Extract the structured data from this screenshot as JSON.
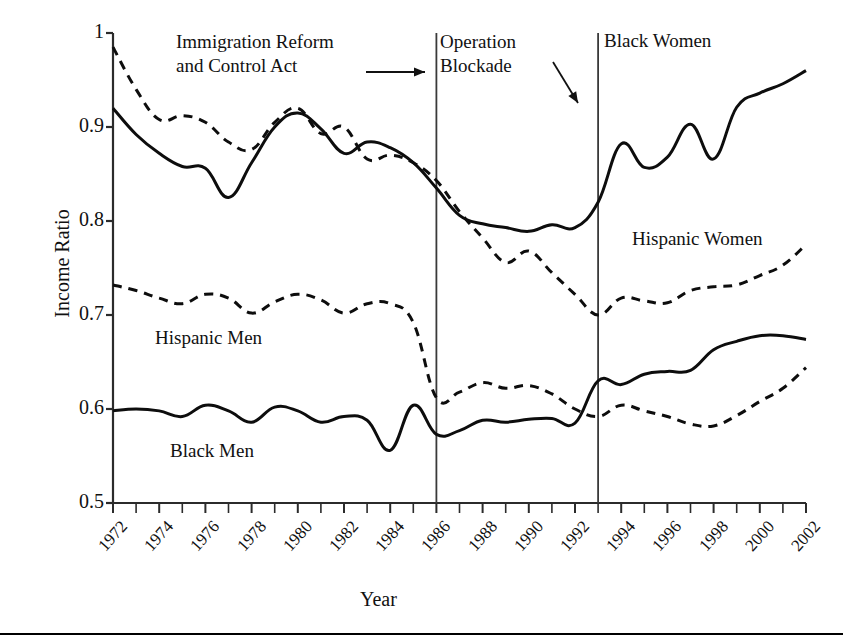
{
  "chart_data": {
    "type": "line",
    "title": "",
    "xlabel": "Year",
    "ylabel": "Income Ratio",
    "xlim": [
      1972,
      2002
    ],
    "ylim": [
      0.5,
      1.0
    ],
    "yticks": [
      "0.5",
      "0.6",
      "0.7",
      "0.8",
      "0.9",
      "1"
    ],
    "ytick_values": [
      0.5,
      0.6,
      0.7,
      0.8,
      0.9,
      1.0
    ],
    "xticks": [
      "1972",
      "1974",
      "1976",
      "1978",
      "1980",
      "1982",
      "1984",
      "1986",
      "1988",
      "1990",
      "1992",
      "1994",
      "1996",
      "1998",
      "2000",
      "2002"
    ],
    "xtick_values": [
      1972,
      1974,
      1976,
      1978,
      1980,
      1982,
      1984,
      1986,
      1988,
      1990,
      1992,
      1994,
      1996,
      1998,
      2000,
      2002
    ],
    "minor_xtick_step": 1,
    "grid": false,
    "legend_position": "inline-annotations",
    "x": [
      1972,
      1973,
      1974,
      1975,
      1976,
      1977,
      1978,
      1979,
      1980,
      1981,
      1982,
      1983,
      1984,
      1985,
      1986,
      1987,
      1988,
      1989,
      1990,
      1991,
      1992,
      1993,
      1994,
      1995,
      1996,
      1997,
      1998,
      1999,
      2000,
      2001,
      2002
    ],
    "series": [
      {
        "name": "Black Women",
        "style": "solid",
        "color": "#000000",
        "values": [
          0.92,
          0.89,
          0.872,
          0.858,
          0.856,
          0.857,
          0.862,
          0.872,
          0.893,
          0.913,
          0.908,
          0.887,
          0.87,
          0.878,
          0.884,
          0.881,
          0.873,
          0.862,
          0.848,
          0.838,
          0.834,
          0.81,
          0.799,
          0.796,
          0.795,
          0.793,
          0.788,
          0.788,
          0.795,
          0.797,
          0.792
        ]
      },
      {
        "name": "Black Women (upper dashed segment)",
        "style": "dashed",
        "color": "#000000",
        "values": [
          0.985,
          0.948,
          0.92,
          0.912,
          0.916,
          0.9,
          0.884,
          0.882,
          0.895,
          0.92,
          0.91,
          0.886,
          0.866,
          0.87,
          0.88,
          0.874,
          0.864,
          0.854,
          0.843,
          0.833,
          0.822,
          0.805,
          0.788,
          0.782,
          0.779,
          0.775,
          0.77,
          0.766,
          0.762,
          0.758,
          0.752
        ]
      },
      {
        "name": "Hispanic Men",
        "style": "dashed",
        "color": "#000000",
        "values": [
          0.73,
          0.722,
          0.716,
          0.71,
          0.705,
          0.701,
          0.712,
          0.721,
          0.719,
          0.711,
          0.703,
          0.701,
          0.71,
          0.711,
          0.702,
          0.683,
          0.67,
          0.662,
          0.661,
          0.651,
          0.645,
          0.637,
          0.628,
          0.621,
          0.617,
          0.612,
          0.608,
          0.612,
          0.616,
          0.622,
          0.631
        ]
      },
      {
        "name": "Black Men",
        "style": "solid",
        "color": "#000000",
        "values": [
          0.598,
          0.6,
          0.599,
          0.594,
          0.589,
          0.602,
          0.606,
          0.596,
          0.587,
          0.582,
          0.59,
          0.588,
          0.583,
          0.578,
          0.572,
          0.576,
          0.58,
          0.584,
          0.586,
          0.586,
          0.585,
          0.585,
          0.583,
          0.58,
          0.578,
          0.578,
          0.58,
          0.585,
          0.59,
          0.598,
          0.608
        ]
      }
    ],
    "series_visual": [
      {
        "name": "Black Women",
        "style": "solid",
        "label_position": "top-right",
        "points": [
          [
            1972,
            0.92
          ],
          [
            1973,
            0.892
          ],
          [
            1974,
            0.872
          ],
          [
            1975,
            0.858
          ],
          [
            1976,
            0.856
          ],
          [
            1977,
            0.825
          ],
          [
            1978,
            0.862
          ],
          [
            1979,
            0.9
          ],
          [
            1980,
            0.915
          ],
          [
            1981,
            0.898
          ],
          [
            1982,
            0.872
          ],
          [
            1983,
            0.884
          ],
          [
            1984,
            0.878
          ],
          [
            1985,
            0.862
          ],
          [
            1986,
            0.835
          ],
          [
            1987,
            0.806
          ],
          [
            1988,
            0.797
          ],
          [
            1989,
            0.793
          ],
          [
            1990,
            0.789
          ],
          [
            1991,
            0.796
          ],
          [
            1992,
            0.793
          ],
          [
            1993,
            0.82
          ],
          [
            1994,
            0.882
          ],
          [
            1995,
            0.857
          ],
          [
            1996,
            0.868
          ],
          [
            1997,
            0.903
          ],
          [
            1998,
            0.866
          ],
          [
            1999,
            0.921
          ],
          [
            2000,
            0.936
          ],
          [
            2001,
            0.946
          ],
          [
            2002,
            0.96
          ]
        ]
      },
      {
        "name": "Hispanic Women",
        "style": "dashed",
        "label_position": "middle-right",
        "points": [
          [
            1972,
            0.985
          ],
          [
            1973,
            0.94
          ],
          [
            1974,
            0.908
          ],
          [
            1975,
            0.912
          ],
          [
            1976,
            0.905
          ],
          [
            1977,
            0.884
          ],
          [
            1978,
            0.876
          ],
          [
            1979,
            0.905
          ],
          [
            1980,
            0.92
          ],
          [
            1981,
            0.893
          ],
          [
            1982,
            0.9
          ],
          [
            1983,
            0.866
          ],
          [
            1984,
            0.87
          ],
          [
            1985,
            0.862
          ],
          [
            1986,
            0.843
          ],
          [
            1987,
            0.81
          ],
          [
            1988,
            0.782
          ],
          [
            1989,
            0.756
          ],
          [
            1990,
            0.768
          ],
          [
            1991,
            0.745
          ],
          [
            1992,
            0.722
          ],
          [
            1993,
            0.7
          ],
          [
            1994,
            0.718
          ],
          [
            1995,
            0.715
          ],
          [
            1996,
            0.713
          ],
          [
            1997,
            0.726
          ],
          [
            1998,
            0.73
          ],
          [
            1999,
            0.732
          ],
          [
            2000,
            0.742
          ],
          [
            2001,
            0.753
          ],
          [
            2002,
            0.775
          ]
        ]
      },
      {
        "name": "Hispanic Men",
        "style": "dashed",
        "label_position": "middle-left",
        "points": [
          [
            1972,
            0.732
          ],
          [
            1973,
            0.726
          ],
          [
            1974,
            0.718
          ],
          [
            1975,
            0.712
          ],
          [
            1976,
            0.722
          ],
          [
            1977,
            0.718
          ],
          [
            1978,
            0.702
          ],
          [
            1979,
            0.714
          ],
          [
            1980,
            0.722
          ],
          [
            1981,
            0.716
          ],
          [
            1982,
            0.702
          ],
          [
            1983,
            0.712
          ],
          [
            1984,
            0.712
          ],
          [
            1985,
            0.692
          ],
          [
            1986,
            0.612
          ],
          [
            1987,
            0.618
          ],
          [
            1988,
            0.628
          ],
          [
            1989,
            0.622
          ],
          [
            1990,
            0.625
          ],
          [
            1991,
            0.616
          ],
          [
            1992,
            0.6
          ],
          [
            1993,
            0.592
          ],
          [
            1994,
            0.604
          ],
          [
            1995,
            0.598
          ],
          [
            1996,
            0.592
          ],
          [
            1997,
            0.584
          ],
          [
            1998,
            0.582
          ],
          [
            1999,
            0.593
          ],
          [
            2000,
            0.608
          ],
          [
            2001,
            0.622
          ],
          [
            2002,
            0.644
          ]
        ]
      },
      {
        "name": "Black Men",
        "style": "solid",
        "label_position": "bottom-left",
        "points": [
          [
            1972,
            0.598
          ],
          [
            1973,
            0.6
          ],
          [
            1974,
            0.598
          ],
          [
            1975,
            0.592
          ],
          [
            1976,
            0.604
          ],
          [
            1977,
            0.598
          ],
          [
            1978,
            0.586
          ],
          [
            1979,
            0.602
          ],
          [
            1980,
            0.598
          ],
          [
            1981,
            0.586
          ],
          [
            1982,
            0.592
          ],
          [
            1983,
            0.588
          ],
          [
            1984,
            0.556
          ],
          [
            1985,
            0.604
          ],
          [
            1986,
            0.573
          ],
          [
            1987,
            0.577
          ],
          [
            1988,
            0.588
          ],
          [
            1989,
            0.586
          ],
          [
            1990,
            0.589
          ],
          [
            1991,
            0.59
          ],
          [
            1992,
            0.585
          ],
          [
            1993,
            0.63
          ],
          [
            1994,
            0.626
          ],
          [
            1995,
            0.637
          ],
          [
            1996,
            0.64
          ],
          [
            1997,
            0.641
          ],
          [
            1998,
            0.663
          ],
          [
            1999,
            0.672
          ],
          [
            2000,
            0.678
          ],
          [
            2001,
            0.678
          ],
          [
            2002,
            0.674
          ]
        ]
      }
    ],
    "event_lines": [
      {
        "name": "Immigration Reform and Control Act",
        "year": 1986
      },
      {
        "name": "Operation Blockade",
        "year": 1993
      }
    ],
    "annotations": [
      {
        "id": "irca",
        "line1": "Immigration Reform",
        "line2": "and Control Act",
        "arrow": "right"
      },
      {
        "id": "blockade",
        "line1": "Operation",
        "line2": "Blockade",
        "arrow": "down-right"
      }
    ],
    "series_labels": {
      "black_women": "Black Women",
      "hispanic_women": "Hispanic Women",
      "hispanic_men": "Hispanic Men",
      "black_men": "Black Men"
    }
  }
}
